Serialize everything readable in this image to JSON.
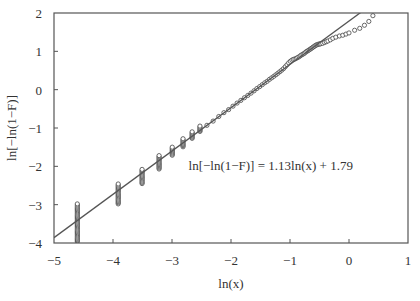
{
  "chart_data": {
    "type": "scatter",
    "title": "",
    "xlabel": "ln(x)",
    "ylabel": "ln[−ln(1−F)]",
    "xlim": [
      -5,
      1
    ],
    "ylim": [
      -4,
      2
    ],
    "xticks": [
      -5,
      -4,
      -3,
      -2,
      -1,
      0,
      1
    ],
    "yticks": [
      -4,
      -3,
      -2,
      -1,
      0,
      1,
      2
    ],
    "xtick_labels": [
      "−5",
      "−4",
      "−3",
      "−2",
      "−1",
      "0",
      "1"
    ],
    "ytick_labels": [
      "−4",
      "−3",
      "−2",
      "−1",
      "0",
      "1",
      "2"
    ],
    "grid": false,
    "legend": null,
    "fit_line": {
      "slope": 1.13,
      "intercept": 1.79,
      "color": "#555555",
      "equation_label": "ln[−ln(1−F)] = 1.13ln(x) + 1.79",
      "label_position": [
        -2.72,
        -2.0
      ]
    },
    "series": [
      {
        "name": "observations",
        "marker": "open-circle",
        "color": "#444444",
        "clusters": [
          {
            "x": -4.605,
            "y_min": -3.97,
            "y_max": -2.98
          },
          {
            "x": -3.912,
            "y_min": -2.98,
            "y_max": -2.46
          },
          {
            "x": -3.507,
            "y_min": -2.45,
            "y_max": -2.08
          },
          {
            "x": -3.219,
            "y_min": -2.07,
            "y_max": -1.72
          },
          {
            "x": -2.996,
            "y_min": -1.71,
            "y_max": -1.5
          },
          {
            "x": -2.813,
            "y_min": -1.49,
            "y_max": -1.28
          },
          {
            "x": -2.659,
            "y_min": -1.27,
            "y_max": -1.1
          },
          {
            "x": -2.526,
            "y_min": -1.09,
            "y_max": -0.95
          }
        ],
        "points": [
          {
            "x": -2.408,
            "y": -0.93
          },
          {
            "x": -2.303,
            "y": -0.82
          },
          {
            "x": -2.207,
            "y": -0.7
          },
          {
            "x": -2.12,
            "y": -0.6
          },
          {
            "x": -2.04,
            "y": -0.52
          },
          {
            "x": -1.966,
            "y": -0.43
          },
          {
            "x": -1.897,
            "y": -0.35
          },
          {
            "x": -1.833,
            "y": -0.28
          },
          {
            "x": -1.772,
            "y": -0.21
          },
          {
            "x": -1.715,
            "y": -0.15
          },
          {
            "x": -1.661,
            "y": -0.09
          },
          {
            "x": -1.609,
            "y": -0.03
          },
          {
            "x": -1.561,
            "y": 0.03
          },
          {
            "x": -1.514,
            "y": 0.08
          },
          {
            "x": -1.47,
            "y": 0.13
          },
          {
            "x": -1.427,
            "y": 0.18
          },
          {
            "x": -1.386,
            "y": 0.22
          },
          {
            "x": -1.347,
            "y": 0.27
          },
          {
            "x": -1.309,
            "y": 0.31
          },
          {
            "x": -1.273,
            "y": 0.35
          },
          {
            "x": -1.238,
            "y": 0.39
          },
          {
            "x": -1.204,
            "y": 0.43
          },
          {
            "x": -1.171,
            "y": 0.47
          },
          {
            "x": -1.139,
            "y": 0.51
          },
          {
            "x": -1.109,
            "y": 0.55
          },
          {
            "x": -1.079,
            "y": 0.6
          },
          {
            "x": -1.05,
            "y": 0.65
          },
          {
            "x": -1.022,
            "y": 0.7
          },
          {
            "x": -0.994,
            "y": 0.74
          },
          {
            "x": -0.968,
            "y": 0.77
          },
          {
            "x": -0.942,
            "y": 0.79
          },
          {
            "x": -0.916,
            "y": 0.8
          },
          {
            "x": -0.892,
            "y": 0.82
          },
          {
            "x": -0.868,
            "y": 0.84
          },
          {
            "x": -0.844,
            "y": 0.86
          },
          {
            "x": -0.821,
            "y": 0.89
          },
          {
            "x": -0.799,
            "y": 0.91
          },
          {
            "x": -0.777,
            "y": 0.93
          },
          {
            "x": -0.755,
            "y": 0.95
          },
          {
            "x": -0.734,
            "y": 0.98
          },
          {
            "x": -0.713,
            "y": 1.0
          },
          {
            "x": -0.693,
            "y": 1.02
          },
          {
            "x": -0.673,
            "y": 1.04
          },
          {
            "x": -0.654,
            "y": 1.06
          },
          {
            "x": -0.635,
            "y": 1.08
          },
          {
            "x": -0.616,
            "y": 1.1
          },
          {
            "x": -0.598,
            "y": 1.12
          },
          {
            "x": -0.58,
            "y": 1.14
          },
          {
            "x": -0.562,
            "y": 1.16
          },
          {
            "x": -0.545,
            "y": 1.17
          },
          {
            "x": -0.528,
            "y": 1.18
          },
          {
            "x": -0.511,
            "y": 1.19
          },
          {
            "x": -0.494,
            "y": 1.19
          },
          {
            "x": -0.478,
            "y": 1.2
          },
          {
            "x": -0.446,
            "y": 1.21
          },
          {
            "x": -0.416,
            "y": 1.23
          },
          {
            "x": -0.386,
            "y": 1.25
          },
          {
            "x": -0.357,
            "y": 1.27
          },
          {
            "x": -0.315,
            "y": 1.3
          },
          {
            "x": -0.274,
            "y": 1.34
          },
          {
            "x": -0.223,
            "y": 1.37
          },
          {
            "x": -0.163,
            "y": 1.4
          },
          {
            "x": -0.105,
            "y": 1.42
          },
          {
            "x": -0.051,
            "y": 1.45
          },
          {
            "x": 0.0,
            "y": 1.48
          },
          {
            "x": 0.095,
            "y": 1.55
          },
          {
            "x": 0.182,
            "y": 1.6
          },
          {
            "x": 0.262,
            "y": 1.68
          },
          {
            "x": 0.336,
            "y": 1.78
          },
          {
            "x": 0.405,
            "y": 1.93
          }
        ]
      }
    ]
  }
}
